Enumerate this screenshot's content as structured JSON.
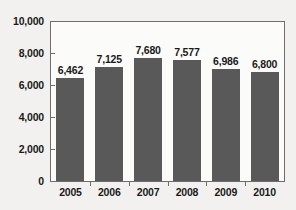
{
  "chart_data": {
    "type": "bar",
    "title": "",
    "subtitle": "",
    "xlabel": "",
    "ylabel": "",
    "categories": [
      "2005",
      "2006",
      "2007",
      "2008",
      "2009",
      "2010"
    ],
    "values": [
      6462,
      7125,
      7680,
      7577,
      6986,
      6800
    ],
    "value_labels": [
      "6,462",
      "7,125",
      "7,680",
      "7,577",
      "6,986",
      "6,800"
    ],
    "ylim": [
      0,
      10000
    ],
    "yticks": [
      0,
      2000,
      4000,
      6000,
      8000,
      10000
    ],
    "ytick_labels": [
      "0",
      "2,000",
      "4,000",
      "6,000",
      "8,000",
      "10,000"
    ],
    "grid": false,
    "legend": null,
    "bar_color": "#595959",
    "axis_color": "#6d6d6d",
    "text_color": "#1a1a1a",
    "background_color": "#f2f1ef",
    "plot_background_color": "#fbfbfa"
  }
}
